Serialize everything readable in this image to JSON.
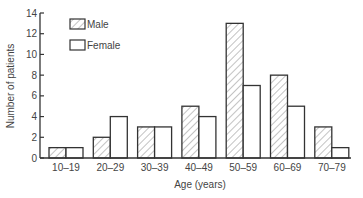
{
  "chart_data": {
    "type": "bar",
    "title": "",
    "xlabel": "Age (years)",
    "ylabel": "Number of patients",
    "categories": [
      "10–19",
      "20–29",
      "30–39",
      "40–49",
      "50–59",
      "60–69",
      "70–79"
    ],
    "series": [
      {
        "name": "Male",
        "pattern": "hatched",
        "values": [
          1,
          2,
          3,
          5,
          13,
          8,
          3
        ]
      },
      {
        "name": "Female",
        "pattern": "open",
        "values": [
          1,
          4,
          3,
          4,
          7,
          5,
          1
        ]
      }
    ],
    "ylim": [
      0,
      14
    ],
    "yticks": [
      0,
      2,
      4,
      6,
      8,
      10,
      12,
      14
    ],
    "grid": false,
    "legend_position": "upper-left-inside"
  },
  "legend": {
    "male_label": "Male",
    "female_label": "Female"
  },
  "colors": {
    "axis": "#333333",
    "bar_stroke": "#333333",
    "hatch": "#888888",
    "text": "#444444"
  }
}
